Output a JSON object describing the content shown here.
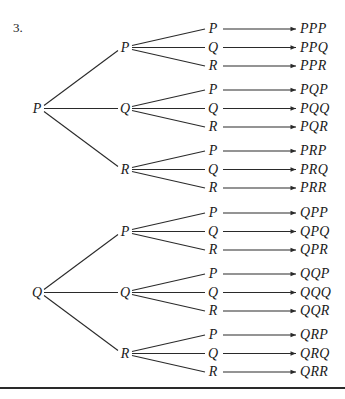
{
  "problem_number": "3.",
  "trees": [
    {
      "root": "P",
      "branches": [
        {
          "label": "P",
          "leaves": [
            {
              "label": "P",
              "result": "PPP"
            },
            {
              "label": "Q",
              "result": "PPQ"
            },
            {
              "label": "R",
              "result": "PPR"
            }
          ]
        },
        {
          "label": "Q",
          "leaves": [
            {
              "label": "P",
              "result": "PQP"
            },
            {
              "label": "Q",
              "result": "PQQ"
            },
            {
              "label": "R",
              "result": "PQR"
            }
          ]
        },
        {
          "label": "R",
          "leaves": [
            {
              "label": "P",
              "result": "PRP"
            },
            {
              "label": "Q",
              "result": "PRQ"
            },
            {
              "label": "R",
              "result": "PRR"
            }
          ]
        }
      ]
    },
    {
      "root": "Q",
      "branches": [
        {
          "label": "P",
          "leaves": [
            {
              "label": "P",
              "result": "QPP"
            },
            {
              "label": "Q",
              "result": "QPQ"
            },
            {
              "label": "R",
              "result": "QPR"
            }
          ]
        },
        {
          "label": "Q",
          "leaves": [
            {
              "label": "P",
              "result": "QQP"
            },
            {
              "label": "Q",
              "result": "QQQ"
            },
            {
              "label": "R",
              "result": "QQR"
            }
          ]
        },
        {
          "label": "R",
          "leaves": [
            {
              "label": "P",
              "result": "QRP"
            },
            {
              "label": "Q",
              "result": "QRQ"
            },
            {
              "label": "R",
              "result": "QRR"
            }
          ]
        }
      ]
    }
  ],
  "colors": {
    "line": "#2a2a2a",
    "text": "#1a1a1a",
    "background": "#ffffff"
  }
}
